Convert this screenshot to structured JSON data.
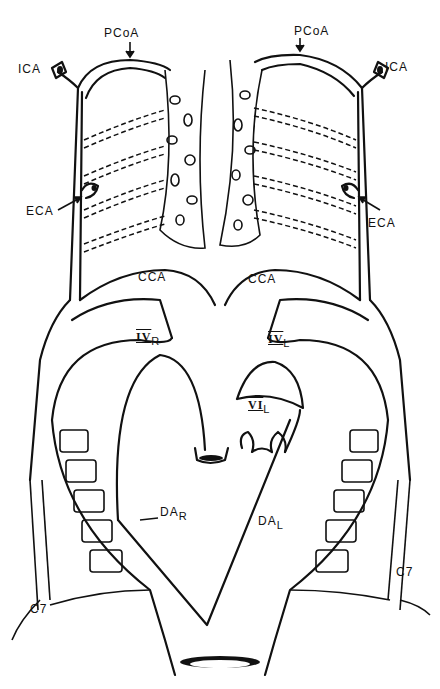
{
  "diagram": {
    "type": "anatomical-vascular-diagram",
    "labels": {
      "pcoa_left": "PCoA",
      "pcoa_right": "PCoA",
      "ica_left": "ICA",
      "ica_right": "ICA",
      "eca_left": "ECA",
      "eca_right": "ECA",
      "cca_left": "CCA",
      "cca_right": "CCA",
      "arch4_right_main": "IV",
      "arch4_right_sub": "R",
      "arch4_left_main": "IV",
      "arch4_left_sub": "L",
      "arch6_left_main": "VI",
      "arch6_left_sub": "L",
      "da_right_main": "DA",
      "da_right_sub": "R",
      "da_left_main": "DA",
      "da_left_sub": "L",
      "c7_left": "C7",
      "c7_right": "C7"
    },
    "colors": {
      "line": "#111111",
      "background": "#ffffff"
    }
  }
}
